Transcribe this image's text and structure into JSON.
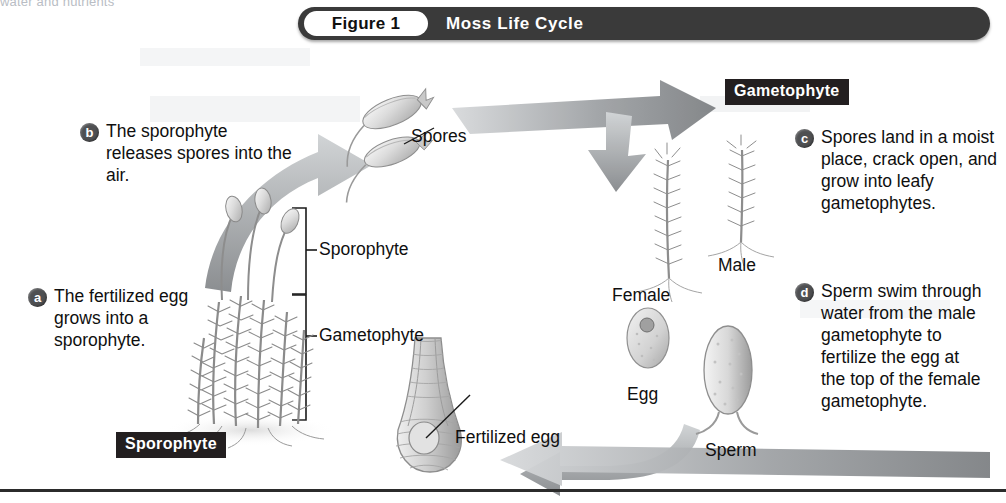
{
  "page": {
    "width": 1006,
    "height": 503,
    "background": "#ffffff",
    "bleed_through_text": "water and nutrients"
  },
  "figure": {
    "pill_label": "Figure 1",
    "title": "Moss Life Cycle",
    "bar_color": "#3a3a3a",
    "pill_color": "#ffffff",
    "title_text_color": "#ffffff"
  },
  "section_labels": [
    {
      "id": "gametophyte",
      "text": "Gametophyte",
      "background": "#231f20",
      "color": "#ffffff"
    },
    {
      "id": "sporophyte",
      "text": "Sporophyte",
      "background": "#231f20",
      "color": "#ffffff"
    }
  ],
  "callouts": [
    {
      "letter": "a",
      "text": "The fertilized egg grows into a sporophyte.",
      "badge_color": "#4f5052"
    },
    {
      "letter": "b",
      "text": "The sporophyte releases spores into the air.",
      "badge_color": "#4f5052"
    },
    {
      "letter": "c",
      "text": "Spores land in a moist place, crack open, and grow into leafy gametophytes.",
      "badge_color": "#4f5052"
    },
    {
      "letter": "d",
      "text": "Sperm swim through water from the male gametophyte to fertilize the egg at the top of the female gametophyte.",
      "badge_color": "#4f5052"
    }
  ],
  "leader_labels": {
    "spores": "Spores",
    "sporophyte_bracket": "Sporophyte",
    "gametophyte_bracket": "Gametophyte",
    "female": "Female",
    "male": "Male",
    "egg": "Egg",
    "sperm": "Sperm",
    "fertilized_egg": "Fertilized egg"
  },
  "diagram": {
    "type": "life-cycle",
    "subject": "Moss",
    "arrow_color": "#8d9093",
    "stage_order": [
      "Sporophyte",
      "Spores",
      "Gametophyte",
      "Egg and Sperm",
      "Fertilized egg"
    ],
    "arrows": [
      {
        "from": "Sporophyte",
        "to": "Spores",
        "direction": "up-right"
      },
      {
        "from": "Spores",
        "to": "Gametophyte",
        "direction": "right-then-down"
      },
      {
        "from": "Egg and Sperm",
        "to": "Fertilized egg",
        "direction": "down-left"
      },
      {
        "from": "Fertilized egg",
        "to": "Sporophyte",
        "direction": "left"
      }
    ]
  }
}
